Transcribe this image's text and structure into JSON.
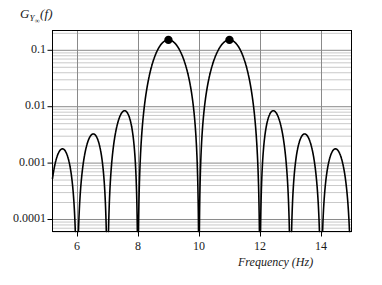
{
  "chart_data": {
    "type": "line",
    "title": "",
    "ylabel": "G_Yinf(f)",
    "xlabel": "Frequency (Hz)",
    "xscale": "linear",
    "yscale": "log",
    "xlim": [
      5.2,
      15.0
    ],
    "ylim": [
      6e-05,
      0.22
    ],
    "grid": true,
    "grid_minor": true,
    "legend": false,
    "xticks": [
      6,
      8,
      10,
      12,
      14
    ],
    "xtick_labels": [
      "6",
      "8",
      "10",
      "12",
      "14"
    ],
    "yticks": [
      0.1,
      0.01,
      0.001,
      0.0001
    ],
    "ytick_labels": [
      "0.1",
      "0.01",
      "0.001",
      "0.0001"
    ],
    "tones": [
      9,
      11
    ],
    "peak_value": 0.15,
    "lobe_width": 1.0,
    "markers": [
      {
        "x": 9,
        "y": 0.15,
        "style": "filled-circle"
      },
      {
        "x": 11,
        "y": 0.15,
        "style": "filled-circle"
      }
    ],
    "side_lobe_peaks": [
      {
        "x": 5.6,
        "y": 0.00016
      },
      {
        "x": 6.5,
        "y": 0.00042
      },
      {
        "x": 7.5,
        "y": 0.0015
      },
      {
        "x": 12.5,
        "y": 0.0015
      },
      {
        "x": 13.5,
        "y": 0.00042
      },
      {
        "x": 14.4,
        "y": 0.00016
      }
    ],
    "nulls": [
      5.2,
      6.0,
      7.0,
      8.0,
      10.0,
      12.0,
      13.0,
      14.0,
      15.0
    ]
  },
  "axis_labels": {
    "y_main": "G",
    "y_sub": "Y",
    "y_subsub": "∞",
    "y_arg": "(f)",
    "x": "Frequency (Hz)"
  },
  "style": {
    "curve_color": "#000000",
    "marker_color": "#000000",
    "frame_color": "#000000",
    "major_grid_color": "#8a8a8a",
    "minor_grid_color": "#c9c9c9",
    "background": "#ffffff"
  }
}
